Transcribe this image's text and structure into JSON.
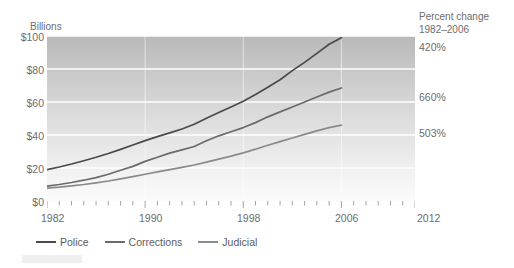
{
  "axis": {
    "y_title": "Billions",
    "y_ticks": [
      "$100",
      "$80",
      "$60",
      "$40",
      "$20",
      "$0"
    ],
    "x_ticks": [
      "1982",
      "1990",
      "1998",
      "2006",
      "2012"
    ]
  },
  "annotations": {
    "pct_header_line1": "Percent change",
    "pct_header_line2": "1982–2006",
    "pct_police": "420%",
    "pct_corrections": "660%",
    "pct_judicial": "503%"
  },
  "legend": {
    "items": [
      {
        "label": "Police",
        "color": "#4a4a4a"
      },
      {
        "label": "Corrections",
        "color": "#6b6b6b"
      },
      {
        "label": "Judicial",
        "color": "#8a8a8a"
      }
    ]
  },
  "chart_data": {
    "type": "line",
    "title": "",
    "xlabel": "",
    "ylabel": "Billions",
    "xlim": [
      1982,
      2012
    ],
    "ylim": [
      0,
      100
    ],
    "grid": true,
    "legend_position": "bottom",
    "x": [
      1982,
      1983,
      1984,
      1985,
      1986,
      1987,
      1988,
      1989,
      1990,
      1991,
      1992,
      1993,
      1994,
      1995,
      1996,
      1997,
      1998,
      1999,
      2000,
      2001,
      2002,
      2003,
      2004,
      2005,
      2006
    ],
    "series": [
      {
        "name": "Police",
        "color": "#4a4a4a",
        "percent_change_1982_2006": "420%",
        "values": [
          19.0,
          20.6,
          22.4,
          24.4,
          26.5,
          28.8,
          31.3,
          33.9,
          36.6,
          39.0,
          41.3,
          43.6,
          46.5,
          50.2,
          53.6,
          57.0,
          60.5,
          64.5,
          69.0,
          73.5,
          79.0,
          84.0,
          89.5,
          95.0,
          99.0
        ]
      },
      {
        "name": "Corrections",
        "color": "#6b6b6b",
        "percent_change_1982_2006": "660%",
        "values": [
          9.0,
          10.0,
          11.2,
          12.6,
          14.2,
          16.2,
          18.6,
          21.0,
          24.0,
          26.5,
          29.0,
          31.0,
          33.0,
          36.5,
          39.5,
          42.0,
          44.5,
          47.5,
          51.0,
          54.0,
          57.0,
          60.0,
          63.0,
          66.0,
          68.5
        ]
      },
      {
        "name": "Judicial",
        "color": "#8a8a8a",
        "percent_change_1982_2006": "503%",
        "values": [
          7.8,
          8.4,
          9.2,
          10.0,
          11.0,
          12.1,
          13.4,
          14.8,
          16.2,
          17.6,
          19.0,
          20.4,
          21.8,
          23.6,
          25.4,
          27.2,
          29.2,
          31.4,
          33.8,
          36.0,
          38.2,
          40.4,
          42.5,
          44.5,
          46.0
        ]
      }
    ]
  }
}
